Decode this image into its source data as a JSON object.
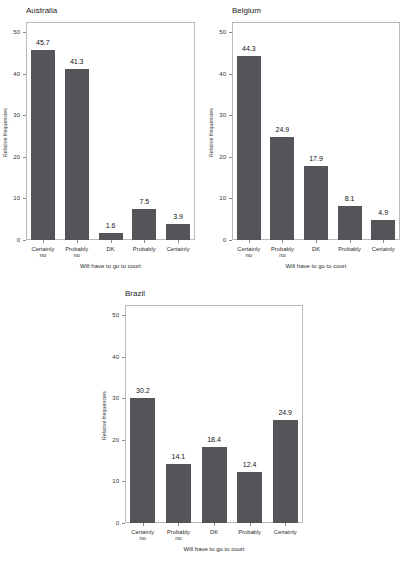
{
  "figure": {
    "background": "#ffffff",
    "bar_color": "#555559",
    "frame_color": "#b9b9b9"
  },
  "chart_data": [
    {
      "type": "bar",
      "title": "Australia",
      "xlabel": "Will have to go to court",
      "ylabel": "Relative frequencies",
      "categories": [
        "Certainly no",
        "Probably no",
        "DK",
        "Probably",
        "Certainly"
      ],
      "category_lines": [
        [
          "Certainly",
          "no"
        ],
        [
          "Probably",
          "no"
        ],
        [
          "DK",
          ""
        ],
        [
          "Probably",
          ""
        ],
        [
          "Certainly",
          ""
        ]
      ],
      "values": [
        45.7,
        41.3,
        1.6,
        7.5,
        3.9
      ],
      "value_labels": [
        "45.7",
        "41.3",
        "1.6",
        "7.5",
        "3.9"
      ],
      "yticks": [
        0,
        10,
        20,
        30,
        40,
        50
      ],
      "ytick_labels": [
        "0",
        "10",
        "20",
        "30",
        "40",
        "50"
      ],
      "ylim": [
        0,
        52.5
      ],
      "grid": false,
      "legend": "none"
    },
    {
      "type": "bar",
      "title": "Belgium",
      "xlabel": "Will have to go to court",
      "ylabel": "Relative frequencies",
      "categories": [
        "Certainly no",
        "Probably no",
        "DK",
        "Probably",
        "Certainly"
      ],
      "category_lines": [
        [
          "Certainly",
          "no"
        ],
        [
          "Probably",
          "no"
        ],
        [
          "DK",
          ""
        ],
        [
          "Probably",
          ""
        ],
        [
          "Certainly",
          ""
        ]
      ],
      "values": [
        44.3,
        24.9,
        17.9,
        8.1,
        4.9
      ],
      "value_labels": [
        "44.3",
        "24.9",
        "17.9",
        "8.1",
        "4.9"
      ],
      "yticks": [
        0,
        10,
        20,
        30,
        40,
        50
      ],
      "ytick_labels": [
        "0",
        "10",
        "20",
        "30",
        "40",
        "50"
      ],
      "ylim": [
        0,
        52.5
      ],
      "grid": false,
      "legend": "none"
    },
    {
      "type": "bar",
      "title": "Brazil",
      "xlabel": "Will have to go to court",
      "ylabel": "Relative frequencies",
      "categories": [
        "Certainly no",
        "Probably no",
        "DK",
        "Probably",
        "Certainly"
      ],
      "category_lines": [
        [
          "Certainly",
          "no"
        ],
        [
          "Probably",
          "no"
        ],
        [
          "DK",
          ""
        ],
        [
          "Probably",
          ""
        ],
        [
          "Certainly",
          ""
        ]
      ],
      "values": [
        30.2,
        14.1,
        18.4,
        12.4,
        24.9
      ],
      "value_labels": [
        "30.2",
        "14.1",
        "18.4",
        "12.4",
        "24.9"
      ],
      "yticks": [
        0,
        10,
        20,
        30,
        40,
        50
      ],
      "ytick_labels": [
        "0",
        "10",
        "20",
        "30",
        "40",
        "50"
      ],
      "ylim": [
        0,
        52.5
      ],
      "grid": false,
      "legend": "none"
    }
  ]
}
